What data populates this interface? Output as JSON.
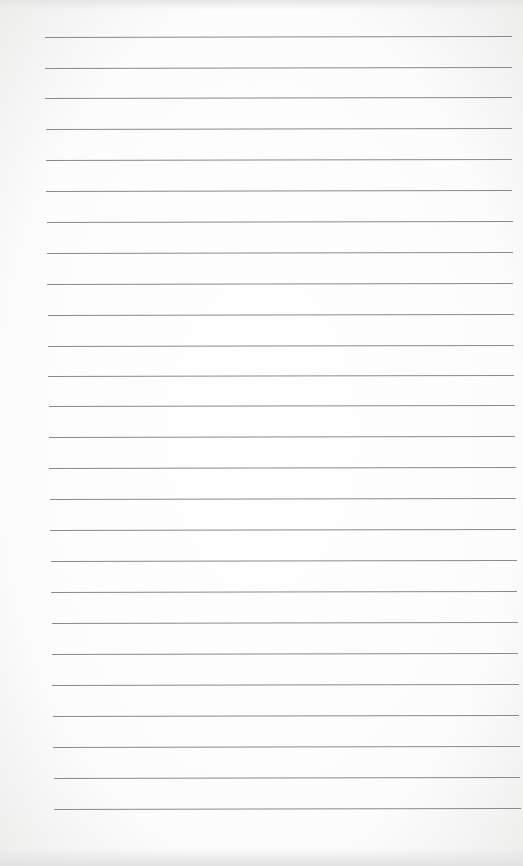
{
  "document": {
    "type": "lined-paper",
    "text": "",
    "rule_color": "#8a8a8a",
    "paper_color": "#ffffff",
    "rules": [
      {
        "y": 37,
        "x1": 45,
        "x2": 512
      },
      {
        "y": 68,
        "x1": 45,
        "x2": 512
      },
      {
        "y": 98,
        "x1": 45,
        "x2": 512
      },
      {
        "y": 129,
        "x1": 46,
        "x2": 512
      },
      {
        "y": 160,
        "x1": 46,
        "x2": 512
      },
      {
        "y": 191,
        "x1": 46,
        "x2": 512
      },
      {
        "y": 222,
        "x1": 47,
        "x2": 513
      },
      {
        "y": 253,
        "x1": 47,
        "x2": 513
      },
      {
        "y": 284,
        "x1": 47,
        "x2": 513
      },
      {
        "y": 315,
        "x1": 48,
        "x2": 514
      },
      {
        "y": 346,
        "x1": 48,
        "x2": 514
      },
      {
        "y": 376,
        "x1": 48,
        "x2": 514
      },
      {
        "y": 406,
        "x1": 49,
        "x2": 515
      },
      {
        "y": 437,
        "x1": 49,
        "x2": 515
      },
      {
        "y": 468,
        "x1": 49,
        "x2": 516
      },
      {
        "y": 499,
        "x1": 50,
        "x2": 516
      },
      {
        "y": 530,
        "x1": 50,
        "x2": 516
      },
      {
        "y": 561,
        "x1": 51,
        "x2": 517
      },
      {
        "y": 592,
        "x1": 51,
        "x2": 517
      },
      {
        "y": 623,
        "x1": 52,
        "x2": 518
      },
      {
        "y": 654,
        "x1": 52,
        "x2": 518
      },
      {
        "y": 685,
        "x1": 52,
        "x2": 519
      },
      {
        "y": 716,
        "x1": 53,
        "x2": 519
      },
      {
        "y": 747,
        "x1": 53,
        "x2": 520
      },
      {
        "y": 778,
        "x1": 54,
        "x2": 520
      },
      {
        "y": 809,
        "x1": 54,
        "x2": 521
      }
    ]
  }
}
